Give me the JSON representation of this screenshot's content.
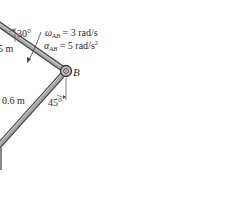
{
  "diagram": {
    "colors": {
      "background": "#ffffff",
      "link_fill": "#9a9a9a",
      "link_edge": "#4a4a4a",
      "text": "#2a2a2a",
      "dim_line": "#555555"
    },
    "links": [
      {
        "name": "AB",
        "length_label": "5 m",
        "angle_label": "30°"
      },
      {
        "name": "BC",
        "length_label": "0.6 m",
        "angle_label": "45°"
      }
    ],
    "pin_label": "B",
    "omega": {
      "symbol": "ω",
      "sub": "AB",
      "value": " = 3 rad/s"
    },
    "alpha": {
      "symbol": "α",
      "sub": "AB",
      "value": " = 5 rad/s",
      "sup": "2"
    }
  }
}
